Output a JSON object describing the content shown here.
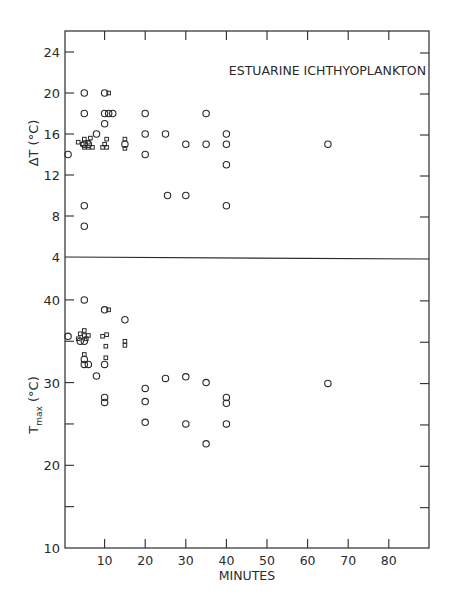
{
  "chart_data": [
    {
      "type": "scatter",
      "panel": "upper",
      "title": "ESTUARINE ICHTHYOPLANKTON",
      "xlabel": "MINUTES",
      "ylabel": "ΔT (°C)",
      "xlim": [
        0,
        90
      ],
      "ylim": [
        4,
        26
      ],
      "yticks": [
        4,
        8,
        12,
        16,
        20,
        24
      ],
      "grid": false,
      "series": [
        {
          "name": "circles",
          "marker": "circle",
          "points": [
            [
              1,
              14
            ],
            [
              5,
              20
            ],
            [
              5,
              18
            ],
            [
              5,
              9
            ],
            [
              5,
              7
            ],
            [
              8,
              16
            ],
            [
              10,
              20
            ],
            [
              10,
              18
            ],
            [
              10,
              17
            ],
            [
              11,
              18
            ],
            [
              12,
              18
            ],
            [
              20,
              18
            ],
            [
              20,
              16
            ],
            [
              20,
              14
            ],
            [
              25,
              16
            ],
            [
              25.5,
              10
            ],
            [
              30,
              15
            ],
            [
              30,
              10
            ],
            [
              35,
              18
            ],
            [
              35,
              15
            ],
            [
              40,
              16
            ],
            [
              40,
              15
            ],
            [
              40,
              13
            ],
            [
              40,
              9
            ],
            [
              65,
              15
            ],
            [
              15,
              15
            ],
            [
              5,
              15
            ],
            [
              6,
              15
            ]
          ]
        },
        {
          "name": "squares",
          "marker": "square",
          "points": [
            [
              3.5,
              15.2
            ],
            [
              4.5,
              15
            ],
            [
              5,
              15.5
            ],
            [
              5,
              14.7
            ],
            [
              6,
              15.2
            ],
            [
              6,
              14.7
            ],
            [
              6.5,
              15.6
            ],
            [
              7,
              14.7
            ],
            [
              9.5,
              14.7
            ],
            [
              10,
              15
            ],
            [
              10.5,
              15.5
            ],
            [
              10.5,
              14.7
            ],
            [
              11,
              20
            ],
            [
              15,
              15.5
            ],
            [
              15,
              14.6
            ]
          ]
        }
      ]
    },
    {
      "type": "scatter",
      "panel": "lower",
      "xlabel": "MINUTES",
      "ylabel": "T_max (°C)",
      "xlim": [
        0,
        90
      ],
      "ylim": [
        10,
        40
      ],
      "xticks": [
        10,
        20,
        30,
        40,
        50,
        60,
        70,
        80
      ],
      "yticks": [
        10,
        20,
        30,
        40
      ],
      "grid": false,
      "series": [
        {
          "name": "circles",
          "marker": "circle",
          "points": [
            [
              1,
              35.6
            ],
            [
              5,
              40
            ],
            [
              4,
              35
            ],
            [
              5,
              35
            ],
            [
              5,
              32.8
            ],
            [
              5,
              32.2
            ],
            [
              6,
              32.2
            ],
            [
              8,
              30.8
            ],
            [
              10,
              38.8
            ],
            [
              10,
              32.2
            ],
            [
              10,
              28.2
            ],
            [
              10,
              27.6
            ],
            [
              15,
              37.6
            ],
            [
              20,
              29.3
            ],
            [
              20,
              27.7
            ],
            [
              20,
              25.2
            ],
            [
              25,
              30.5
            ],
            [
              30,
              30.7
            ],
            [
              30,
              25
            ],
            [
              35,
              30
            ],
            [
              35,
              22.6
            ],
            [
              40,
              28.2
            ],
            [
              40,
              27.5
            ],
            [
              40,
              25
            ],
            [
              65,
              29.9
            ]
          ]
        },
        {
          "name": "squares",
          "marker": "square",
          "points": [
            [
              3.5,
              35.3
            ],
            [
              4,
              35.9
            ],
            [
              5,
              36.3
            ],
            [
              5,
              35.7
            ],
            [
              5.5,
              35.3
            ],
            [
              6,
              35.7
            ],
            [
              5,
              33.4
            ],
            [
              9.5,
              35.6
            ],
            [
              10.5,
              35.8
            ],
            [
              10.3,
              34.4
            ],
            [
              10.3,
              33
            ],
            [
              11,
              38.8
            ],
            [
              15,
              35
            ],
            [
              15,
              34.5
            ]
          ]
        }
      ]
    }
  ],
  "labels": {
    "title": "ESTUARINE ICHTHYOPLANKTON",
    "xlabel": "MINUTES",
    "upper_ylabel": "ΔT (°C)",
    "lower_ylabel_main": "T",
    "lower_ylabel_sub": "max",
    "lower_ylabel_unit": " (°C)",
    "upper_ticks": [
      "24",
      "20",
      "16",
      "12",
      "8",
      "4"
    ],
    "lower_ticks": [
      "40",
      "30",
      "20",
      "10"
    ],
    "x_ticks": [
      "10",
      "20",
      "30",
      "40",
      "50",
      "60",
      "70",
      "80"
    ]
  }
}
